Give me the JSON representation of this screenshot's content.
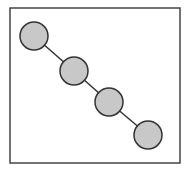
{
  "diagram": {
    "frame": {
      "x": 10,
      "y": 8,
      "width": 170,
      "height": 155,
      "stroke": "#444444"
    },
    "nodes": [
      {
        "id": "n1",
        "cx": 34,
        "cy": 36,
        "r": 14
      },
      {
        "id": "n2",
        "cx": 74,
        "cy": 71,
        "r": 14
      },
      {
        "id": "n3",
        "cx": 109,
        "cy": 102,
        "r": 14
      },
      {
        "id": "n4",
        "cx": 148,
        "cy": 135,
        "r": 14
      }
    ],
    "edges": [
      [
        "n1",
        "n2"
      ],
      [
        "n2",
        "n3"
      ],
      [
        "n3",
        "n4"
      ]
    ],
    "colors": {
      "node_fill": "#c8c8c8",
      "node_stroke": "#333333",
      "edge": "#333333"
    }
  }
}
